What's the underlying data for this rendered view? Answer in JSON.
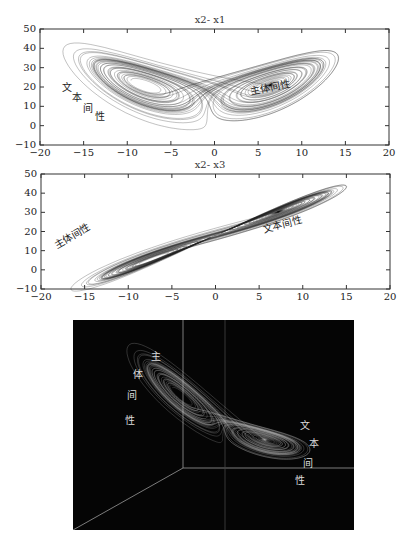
{
  "chart_data": [
    {
      "type": "line",
      "title": "x2- x1",
      "xlabel": "",
      "ylabel": "",
      "xlim": [
        -20,
        20
      ],
      "ylim": [
        -10,
        50
      ],
      "xticks": [
        -20,
        -15,
        -10,
        -5,
        0,
        5,
        10,
        15,
        20
      ],
      "yticks": [
        -10,
        0,
        10,
        20,
        30,
        40,
        50
      ],
      "grid": false,
      "series": [
        {
          "name": "Lorenz attractor projection (x vs z)",
          "description": "butterfly-shaped two-lobed trajectory, lobe centers near (-9,21) and (8,19)"
        }
      ],
      "annotations": [
        {
          "text": "文本间性",
          "layout": "diagonal-stepped",
          "approx_x": -17,
          "approx_y": 15
        },
        {
          "text": "主体间性",
          "layout": "rotated",
          "approx_x": 8,
          "approx_y": 20
        }
      ]
    },
    {
      "type": "line",
      "title": "x2- x3",
      "xlabel": "",
      "ylabel": "",
      "xlim": [
        -20,
        20
      ],
      "ylim": [
        -10,
        50
      ],
      "xticks": [
        -20,
        -15,
        -10,
        -5,
        0,
        5,
        10,
        15,
        20
      ],
      "yticks": [
        -10,
        0,
        10,
        20,
        30,
        40,
        50
      ],
      "grid": false,
      "series": [
        {
          "name": "Lorenz attractor projection (x vs y)",
          "description": "figure-eight trajectory rising left-to-right, lobe centers near (-9,8) and (9,29)"
        }
      ],
      "annotations": [
        {
          "text": "主体间性",
          "layout": "rotated",
          "approx_x": -15,
          "approx_y": 14
        },
        {
          "text": "文本间性",
          "layout": "rotated",
          "approx_x": 9,
          "approx_y": 28
        }
      ]
    },
    {
      "type": "line",
      "title": "",
      "description": "3D rendering of Lorenz attractor on black background with light axes",
      "annotations": [
        {
          "text": "主体间性",
          "layout": "vertical-stepped",
          "position": "upper-left lobe"
        },
        {
          "text": "文本间性",
          "layout": "vertical-stepped",
          "position": "lower-right lobe"
        }
      ]
    }
  ],
  "plots": {
    "top": {
      "title": "x2- x1",
      "label_left": [
        "文",
        "本",
        "间",
        "性"
      ],
      "label_right": "主体间性",
      "xticks": [
        "−20",
        "−15",
        "−10",
        "−5",
        "0",
        "5",
        "10",
        "15",
        "20"
      ],
      "yticks": [
        "50",
        "40",
        "30",
        "20",
        "10",
        "0",
        "−10"
      ]
    },
    "middle": {
      "title": "x2- x3",
      "label_left": "主体间性",
      "label_right": "文本间性",
      "xticks": [
        "−20",
        "−15",
        "−10",
        "−5",
        "0",
        "5",
        "10",
        "15",
        "20"
      ],
      "yticks": [
        "50",
        "40",
        "30",
        "20",
        "10",
        "0",
        "−10"
      ]
    },
    "bottom": {
      "label_upper": [
        "主",
        "体",
        "间",
        "性"
      ],
      "label_lower": [
        "文",
        "本",
        "间",
        "性"
      ]
    }
  }
}
